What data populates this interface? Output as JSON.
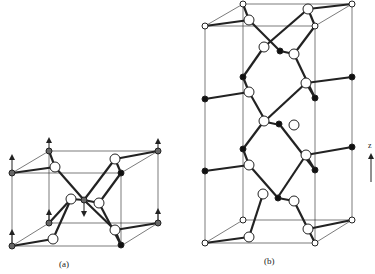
{
  "figure": {
    "panels": [
      {
        "id": "a",
        "label": "(a)"
      },
      {
        "id": "b",
        "label": "(b)"
      }
    ],
    "axis_label": "z",
    "colors": {
      "line": "#222222",
      "open_atom": "#ffffff",
      "filled_atom": "#111111",
      "grey_atom": "#666666"
    }
  }
}
